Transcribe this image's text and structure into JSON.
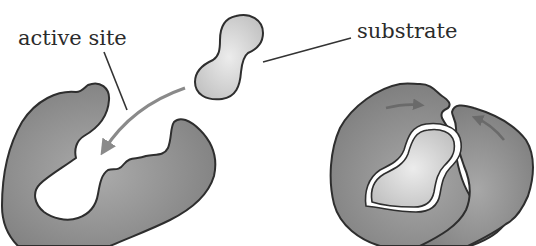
{
  "diagram": {
    "type": "enzyme-substrate induced fit",
    "labels": {
      "active_site": "active site",
      "substrate": "substrate"
    },
    "colors": {
      "enzyme_fill_dark": "#7f7f7f",
      "enzyme_fill_light": "#a9a9a9",
      "substrate_fill_light": "#e2e2e2",
      "substrate_fill_dark": "#c4c4c4",
      "outline": "#2e2e2e",
      "arrow": "#8a8a8a",
      "background": "#ffffff"
    },
    "elements": [
      {
        "id": "substrate-free",
        "description": "free substrate molecule (peanut shape)"
      },
      {
        "id": "enzyme-open",
        "description": "enzyme with open active site"
      },
      {
        "id": "binding-arrow",
        "description": "curved arrow: substrate moves into active site"
      },
      {
        "id": "enzyme-substrate-complex",
        "description": "enzyme closed around bound substrate"
      },
      {
        "id": "closing-arrows",
        "description": "two arrows showing enzyme conformational change"
      }
    ]
  }
}
